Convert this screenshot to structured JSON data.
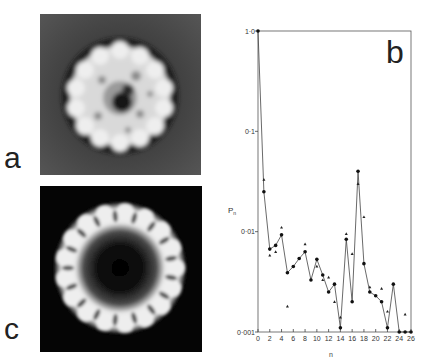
{
  "panels": {
    "a": {
      "label": "a",
      "description": "electron micrograph of ring-shaped particle (negative stain)"
    },
    "b": {
      "label": "b"
    },
    "c": {
      "label": "c",
      "description": "rotationally filtered image showing 17-fold symmetric ring"
    }
  },
  "chart_data": {
    "type": "scatter",
    "title": "",
    "xlabel": "n",
    "ylabel": "Pn",
    "xlim": [
      0,
      26
    ],
    "ylim": [
      0.001,
      1.0
    ],
    "yscale": "log",
    "grid": false,
    "x_ticks": [
      "0",
      "2",
      "4",
      "6",
      "8",
      "10",
      "12",
      "14",
      "16",
      "18",
      "20",
      "22",
      "24",
      "26"
    ],
    "y_ticks": [
      "0·001",
      "0·01",
      "0·1",
      "1·0"
    ],
    "series": [
      {
        "name": "circles (connected line)",
        "marker": "circle",
        "x": [
          0,
          1,
          2,
          3,
          4,
          5,
          6,
          7,
          8,
          9,
          10,
          11,
          12,
          13,
          14,
          15,
          16,
          17,
          18,
          19,
          20,
          21,
          22,
          23,
          24,
          25,
          26
        ],
        "values": [
          1.0,
          0.025,
          0.0067,
          0.0073,
          0.0093,
          0.0039,
          0.0045,
          0.0054,
          0.0063,
          0.0033,
          0.0053,
          0.0037,
          0.0025,
          0.003,
          0.0011,
          0.0084,
          0.002,
          0.04,
          0.0048,
          0.0025,
          0.0023,
          0.002,
          0.0011,
          0.003,
          0.001,
          0.001,
          0.001
        ]
      },
      {
        "name": "triangles",
        "marker": "triangle",
        "x": [
          1,
          2,
          3,
          4,
          5,
          8,
          10,
          11,
          12,
          13,
          14,
          15,
          16,
          17,
          18,
          19,
          21,
          22,
          25
        ],
        "values": [
          0.033,
          0.0058,
          0.0063,
          0.011,
          0.0018,
          0.0075,
          0.0045,
          0.0033,
          0.0035,
          0.002,
          0.0014,
          0.0095,
          0.006,
          0.03,
          0.014,
          0.0028,
          0.0027,
          0.0016,
          0.0015
        ]
      }
    ]
  }
}
